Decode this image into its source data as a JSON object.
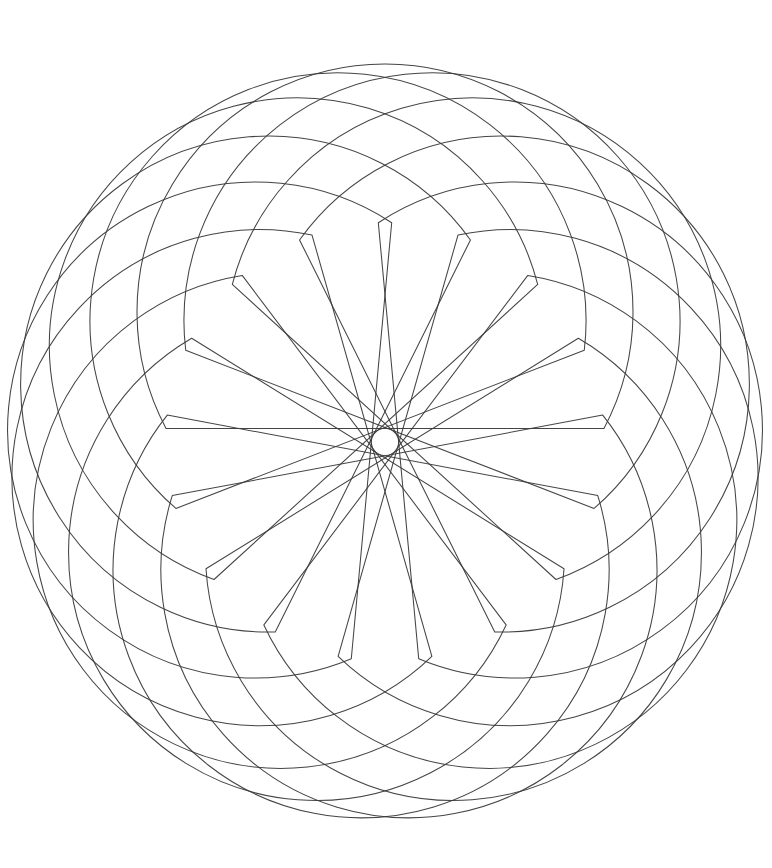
{
  "artwork": {
    "title": "Rotating Circle-And-Chord Rosette",
    "type": "generative-geometric-line-drawing",
    "description": "A rosette formed by many rotated copies of a closed shape made of one large circular arc plus a straight chord; overlapping copies leave an empty rounded-polygon hole at the centre.",
    "background_color": "#ffffff",
    "stroke_color": "#3a3a3a",
    "stroke_width": 1.05,
    "stroke_opacity": 0.95,
    "canvas": {
      "width": 772,
      "height": 868
    }
  },
  "geometry": {
    "center_x": 385,
    "center_y": 442,
    "shape_radius": 248,
    "orbit_radius": 130,
    "copies": 17,
    "start_angle_deg": -90,
    "rotation_step_deg": 21.17647,
    "chord_half_angle_deg": 62,
    "notes": "Each copy is a circle of radius shape_radius whose centre sits on a circle of radius orbit_radius around (center_x, center_y); the arc is closed off by a straight chord subtending 2 x chord_half_angle_deg."
  },
  "extents": {
    "top_y": 66,
    "bottom_y": 822,
    "left_x": 18,
    "right_x": 772,
    "clipped_edges": [
      "right"
    ]
  },
  "chart_data": {
    "type": "line",
    "xlabel": "",
    "ylabel": "",
    "xlim": [
      0,
      772
    ],
    "ylim": [
      0,
      868
    ],
    "grid": false,
    "legend": "none",
    "series": [
      {
        "name": "copy-00",
        "rotation_deg": 0,
        "circle_center": [
          385,
          312
        ],
        "radius": 248,
        "chord_half_angle_deg": 62
      },
      {
        "name": "copy-01",
        "rotation_deg": 21.18,
        "circle_center": [
          432,
          320
        ],
        "radius": 248,
        "chord_half_angle_deg": 62
      },
      {
        "name": "copy-02",
        "rotation_deg": 42.35,
        "circle_center": [
          473,
          344
        ],
        "radius": 248,
        "chord_half_angle_deg": 62
      },
      {
        "name": "copy-03",
        "rotation_deg": 63.53,
        "circle_center": [
          503,
          384
        ],
        "radius": 248,
        "chord_half_angle_deg": 62
      },
      {
        "name": "copy-04",
        "rotation_deg": 84.71,
        "circle_center": [
          514,
          430
        ],
        "radius": 248,
        "chord_half_angle_deg": 62
      },
      {
        "name": "copy-05",
        "rotation_deg": 105.88,
        "circle_center": [
          508,
          478
        ],
        "radius": 248,
        "chord_half_angle_deg": 62
      },
      {
        "name": "copy-06",
        "rotation_deg": 127.06,
        "circle_center": [
          482,
          520
        ],
        "radius": 248,
        "chord_half_angle_deg": 62
      },
      {
        "name": "copy-07",
        "rotation_deg": 148.24,
        "circle_center": [
          441,
          550
        ],
        "radius": 248,
        "chord_half_angle_deg": 62
      },
      {
        "name": "copy-08",
        "rotation_deg": 169.41,
        "circle_center": [
          393,
          565
        ],
        "radius": 248,
        "chord_half_angle_deg": 62
      },
      {
        "name": "copy-09",
        "rotation_deg": 190.59,
        "circle_center": [
          344,
          562
        ],
        "radius": 248,
        "chord_half_angle_deg": 62
      },
      {
        "name": "copy-10",
        "rotation_deg": 211.76,
        "circle_center": [
          300,
          540
        ],
        "radius": 248,
        "chord_half_angle_deg": 62
      },
      {
        "name": "copy-11",
        "rotation_deg": 232.94,
        "circle_center": [
          269,
          503
        ],
        "radius": 248,
        "chord_half_angle_deg": 62
      },
      {
        "name": "copy-12",
        "rotation_deg": 254.12,
        "circle_center": [
          256,
          457
        ],
        "radius": 248,
        "chord_half_angle_deg": 62
      },
      {
        "name": "copy-13",
        "rotation_deg": 275.29,
        "circle_center": [
          259,
          409
        ],
        "radius": 248,
        "chord_half_angle_deg": 62
      },
      {
        "name": "copy-14",
        "rotation_deg": 296.47,
        "circle_center": [
          281,
          366
        ],
        "radius": 248,
        "chord_half_angle_deg": 62
      },
      {
        "name": "copy-15",
        "rotation_deg": 317.65,
        "circle_center": [
          319,
          334
        ],
        "radius": 248,
        "chord_half_angle_deg": 62
      },
      {
        "name": "copy-16",
        "rotation_deg": 338.82,
        "circle_center": [
          366,
          316
        ],
        "radius": 248,
        "chord_half_angle_deg": 62
      }
    ]
  }
}
